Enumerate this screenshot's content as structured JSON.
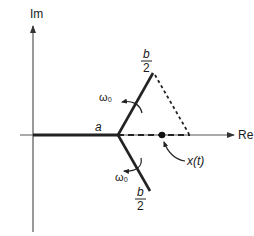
{
  "diagram": {
    "type": "complex-plane-branch-diagram",
    "axes": {
      "vertical_label": "Im",
      "horizontal_label": "Re"
    },
    "labels": {
      "branch_point": "a",
      "upper_branch_num": "b",
      "upper_branch_den": "2",
      "lower_branch_num": "b",
      "lower_branch_den": "2",
      "upper_rotation": "ω₀",
      "lower_rotation": "ω₀",
      "point": "x(t)"
    },
    "colors": {
      "ink": "#1a1a1a",
      "axis": "#555555"
    }
  }
}
